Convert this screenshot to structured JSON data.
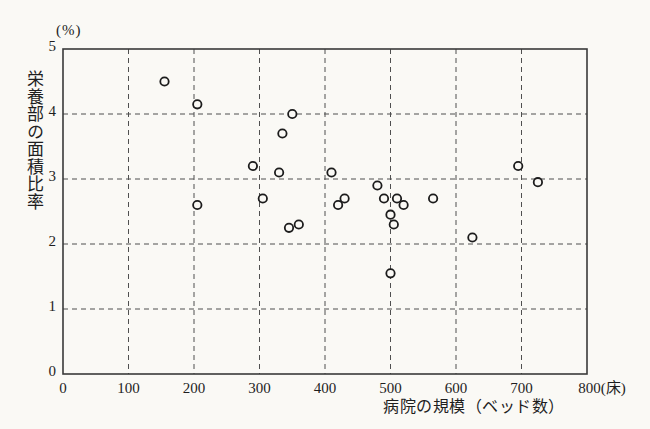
{
  "chart_data": {
    "type": "scatter",
    "title": "",
    "x_axis": {
      "label": "病院の規模（ベッド数）",
      "unit": "床",
      "range": [
        0,
        800
      ],
      "ticks": [
        0,
        100,
        200,
        300,
        400,
        500,
        600,
        700,
        800
      ],
      "tick_labels": [
        "0",
        "100",
        "200",
        "300",
        "400",
        "500",
        "600",
        "700",
        "800(床)"
      ]
    },
    "y_axis": {
      "label": "栄養部の面積比率",
      "unit": "(%)",
      "range": [
        0,
        5
      ],
      "ticks": [
        0,
        1,
        2,
        3,
        4,
        5
      ],
      "tick_labels": [
        "0",
        "1",
        "2",
        "3",
        "4",
        "5"
      ]
    },
    "grid": {
      "style": "dashed",
      "color": "#4f4f4f",
      "on": true
    },
    "legend": {
      "visible": false
    },
    "marker": {
      "shape": "open-circle",
      "stroke": "#1c1c1c",
      "fill": "#faf9f5",
      "radius": 4.2
    },
    "frame_color": "#3a3a3a",
    "paper_color": "#faf9f5",
    "points": [
      [
        155,
        4.5
      ],
      [
        205,
        4.15
      ],
      [
        205,
        2.6
      ],
      [
        290,
        3.2
      ],
      [
        305,
        2.7
      ],
      [
        330,
        3.1
      ],
      [
        335,
        3.7
      ],
      [
        345,
        2.25
      ],
      [
        350,
        4.0
      ],
      [
        360,
        2.3
      ],
      [
        410,
        3.1
      ],
      [
        420,
        2.6
      ],
      [
        430,
        2.7
      ],
      [
        480,
        2.9
      ],
      [
        490,
        2.7
      ],
      [
        500,
        2.45
      ],
      [
        500,
        1.55
      ],
      [
        505,
        2.3
      ],
      [
        510,
        2.7
      ],
      [
        520,
        2.6
      ],
      [
        565,
        2.7
      ],
      [
        625,
        2.1
      ],
      [
        695,
        3.2
      ],
      [
        725,
        2.95
      ]
    ]
  }
}
